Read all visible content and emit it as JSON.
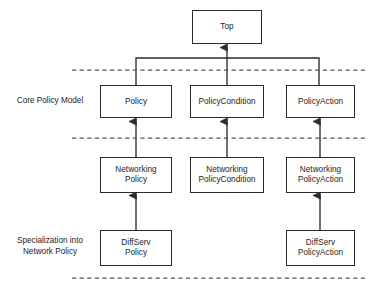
{
  "diagram": {
    "type": "uml-class-hierarchy",
    "background_color": "#ffffff",
    "line_color": "#2b2b2b",
    "dashed_color": "#555555",
    "text_color": "#1c1c1c"
  },
  "band_labels": [
    {
      "id": "core-policy-model",
      "text": "Core Policy Model"
    },
    {
      "id": "specialization-into-network-policy",
      "text": "Specialization into\nNetwork Policy"
    }
  ],
  "nodes": [
    {
      "id": "top",
      "label": "Top",
      "row": "root",
      "column": "middle"
    },
    {
      "id": "policy",
      "label": "Policy",
      "row": "core",
      "column": "left"
    },
    {
      "id": "policy-condition",
      "label": "PolicyCondition",
      "row": "core",
      "column": "middle"
    },
    {
      "id": "policy-action",
      "label": "PolicyAction",
      "row": "core",
      "column": "right"
    },
    {
      "id": "networking-policy",
      "label": "Networking\nPolicy",
      "row": "networking",
      "column": "left"
    },
    {
      "id": "networking-policy-condition",
      "label": "Networking\nPolicyCondition",
      "row": "networking",
      "column": "middle"
    },
    {
      "id": "networking-policy-action",
      "label": "Networking\nPolicyAction",
      "row": "networking",
      "column": "right"
    },
    {
      "id": "diffserv-policy",
      "label": "DiffServ\nPolicy",
      "row": "diffserv",
      "column": "left"
    },
    {
      "id": "diffserv-policy-action",
      "label": "DiffServ\nPolicyAction",
      "row": "diffserv",
      "column": "right"
    }
  ],
  "edges": [
    {
      "from": "policy",
      "to": "top",
      "kind": "generalization"
    },
    {
      "from": "policy-condition",
      "to": "top",
      "kind": "generalization"
    },
    {
      "from": "policy-action",
      "to": "top",
      "kind": "generalization"
    },
    {
      "from": "networking-policy",
      "to": "policy",
      "kind": "generalization"
    },
    {
      "from": "networking-policy-condition",
      "to": "policy-condition",
      "kind": "generalization"
    },
    {
      "from": "networking-policy-action",
      "to": "policy-action",
      "kind": "generalization"
    },
    {
      "from": "diffserv-policy",
      "to": "networking-policy",
      "kind": "generalization"
    },
    {
      "from": "diffserv-policy-action",
      "to": "networking-policy-action",
      "kind": "generalization"
    }
  ],
  "separators": [
    {
      "id": "separator-top",
      "y": 70
    },
    {
      "id": "separator-middle",
      "y": 138
    },
    {
      "id": "separator-bottom",
      "y": 278
    }
  ]
}
